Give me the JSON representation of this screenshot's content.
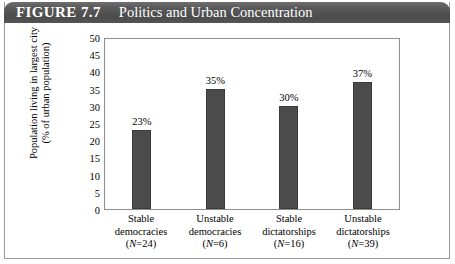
{
  "figure": {
    "label": "FIGURE 7.7",
    "title": "Politics and Urban Concentration",
    "header_bg": "#555555",
    "header_text_color": "#ffffff",
    "border_color": "#9a9a9a"
  },
  "chart_data": {
    "type": "bar",
    "title": "Politics and Urban Concentration",
    "xlabel": "",
    "ylabel": "Population living in largest city (% of urban population)",
    "ylabel_line1": "Population living in largest city",
    "ylabel_line2": "(% of urban population)",
    "ylim": [
      0,
      50
    ],
    "yticks": [
      50,
      45,
      40,
      35,
      30,
      25,
      20,
      15,
      10,
      5,
      0
    ],
    "ytick_labels": [
      "50",
      "45",
      "40",
      "35",
      "30",
      "25",
      "20",
      "15",
      "10",
      "5",
      "0"
    ],
    "grid": false,
    "legend": "none",
    "bar_color": "#4b4b4b",
    "categories": [
      "Stable democracies",
      "Unstable democracies",
      "Stable dictatorships",
      "Unstable dictatorships"
    ],
    "category_lines": [
      {
        "line1": "Stable",
        "line2": "democracies",
        "line3_prefix": "(",
        "line3_n": "N",
        "line3_suffix": "=24)"
      },
      {
        "line1": "Unstable",
        "line2": "democracies",
        "line3_prefix": "(",
        "line3_n": "N",
        "line3_suffix": "=6)"
      },
      {
        "line1": "Stable",
        "line2": "dictatorships",
        "line3_prefix": "(",
        "line3_n": "N",
        "line3_suffix": "=16)"
      },
      {
        "line1": "Unstable",
        "line2": "dictatorships",
        "line3_prefix": "(",
        "line3_n": "N",
        "line3_suffix": "=39)"
      }
    ],
    "sample_sizes": [
      24,
      6,
      16,
      39
    ],
    "values": [
      23,
      35,
      30,
      37
    ],
    "value_labels": [
      "23%",
      "35%",
      "30%",
      "37%"
    ]
  }
}
